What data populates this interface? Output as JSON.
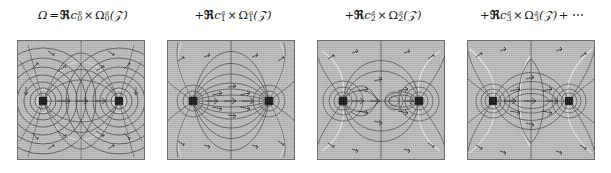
{
  "figure": {
    "type": "multipole-field-decomposition",
    "background_color": "#ffffff",
    "panel_background_color": "#b8b8b8",
    "panel_border_color": "#6e6e6e",
    "contour_color": "#3a3a3a",
    "highlight_color": "#f2f2f2",
    "arrow_color": "#2a2a2a",
    "singularity_color": "#111111"
  },
  "panels": [
    {
      "index": 0,
      "formula": {
        "lhs": "Ω",
        "equals": "=",
        "plus": "",
        "frak_R": "ℜ",
        "c_symbol": "c",
        "c_sub": "0",
        "superscript": "dl",
        "times": "×",
        "omega": "Ω",
        "omega_sub": "0",
        "omega_sup": "dl",
        "argument": "(𝒵)",
        "trailing": ""
      },
      "plot": {
        "label": "monopole-dipole-order-0",
        "mode_order": 0,
        "singularity_count": 2,
        "singularity_x": [
          0.2,
          0.8
        ],
        "singularity_y": [
          0.5,
          0.5
        ]
      }
    },
    {
      "index": 1,
      "formula": {
        "lhs": "",
        "equals": "",
        "plus": "+",
        "frak_R": "ℜ",
        "c_symbol": "c",
        "c_sub": "1",
        "superscript": "dl",
        "times": "×",
        "omega": "Ω",
        "omega_sub": "1",
        "omega_sup": "dl",
        "argument": "(𝒵)",
        "trailing": ""
      },
      "plot": {
        "label": "multipole-order-1",
        "mode_order": 1,
        "singularity_count": 2,
        "singularity_x": [
          0.2,
          0.8
        ],
        "singularity_y": [
          0.5,
          0.5
        ]
      }
    },
    {
      "index": 2,
      "formula": {
        "lhs": "",
        "equals": "",
        "plus": "+",
        "frak_R": "ℜ",
        "c_symbol": "c",
        "c_sub": "2",
        "superscript": "dl",
        "times": "×",
        "omega": "Ω",
        "omega_sub": "2",
        "omega_sup": "dl",
        "argument": "(𝒵)",
        "trailing": ""
      },
      "plot": {
        "label": "multipole-order-2",
        "mode_order": 2,
        "singularity_count": 2,
        "singularity_x": [
          0.2,
          0.8
        ],
        "singularity_y": [
          0.5,
          0.5
        ]
      }
    },
    {
      "index": 3,
      "formula": {
        "lhs": "",
        "equals": "",
        "plus": "+",
        "frak_R": "ℜ",
        "c_symbol": "c",
        "c_sub": "3",
        "superscript": "dl",
        "times": "×",
        "omega": "Ω",
        "omega_sub": "3",
        "omega_sup": "dl",
        "argument": "(𝒵)",
        "trailing": "+ ⋯"
      },
      "plot": {
        "label": "multipole-order-3",
        "mode_order": 3,
        "singularity_count": 2,
        "singularity_x": [
          0.2,
          0.8
        ],
        "singularity_y": [
          0.5,
          0.5
        ]
      }
    }
  ]
}
